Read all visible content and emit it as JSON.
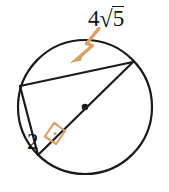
{
  "figure": {
    "type": "geometry-diagram",
    "background_color": "#ffffff",
    "stroke_color": "#1a1a1a",
    "accent_color": "#d9a066",
    "labels": {
      "chord": {
        "name": "chord-length-label",
        "coefficient": "4",
        "radical_symbol": "√",
        "radicand": "5",
        "full_text": "4√5"
      },
      "leg": {
        "name": "leg-length-label",
        "value": "2"
      }
    },
    "annotations": {
      "arrow": {
        "name": "pointer-arrow",
        "color": "#d9a066",
        "points_to": "chord",
        "from_x": 99,
        "from_y": 29,
        "to_x": 72,
        "to_y": 61
      },
      "right_angle": {
        "name": "right-angle-marker",
        "color": "#d9a066",
        "vertex_x": 38,
        "vertex_y": 155,
        "symbol": "square-with-dot"
      },
      "center_point": {
        "name": "circle-center-dot",
        "color": "#1a1a1a",
        "x": 85,
        "y": 107
      }
    },
    "geometry": {
      "circle": {
        "cx": 85,
        "cy": 107,
        "r": 67
      },
      "vertices": {
        "left": {
          "x": 20,
          "y": 86
        },
        "top_right": {
          "x": 133,
          "y": 62
        },
        "bottom_left": {
          "x": 38,
          "y": 155
        }
      },
      "segments": [
        {
          "name": "chord-top",
          "from": "left",
          "to": "top_right"
        },
        {
          "name": "diameter",
          "from": "bottom_left",
          "to": "top_right"
        },
        {
          "name": "leg",
          "from": "left",
          "to": "bottom_left"
        }
      ]
    }
  }
}
